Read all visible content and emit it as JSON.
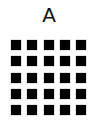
{
  "panel": {
    "label": "A",
    "grid": {
      "rows": 5,
      "cols": 5,
      "cell_color": "#000000",
      "cells": [
        [
          1,
          1,
          1,
          1,
          1
        ],
        [
          1,
          1,
          1,
          1,
          1
        ],
        [
          1,
          1,
          1,
          1,
          1
        ],
        [
          1,
          1,
          1,
          1,
          1
        ],
        [
          1,
          1,
          1,
          1,
          1
        ]
      ]
    }
  }
}
